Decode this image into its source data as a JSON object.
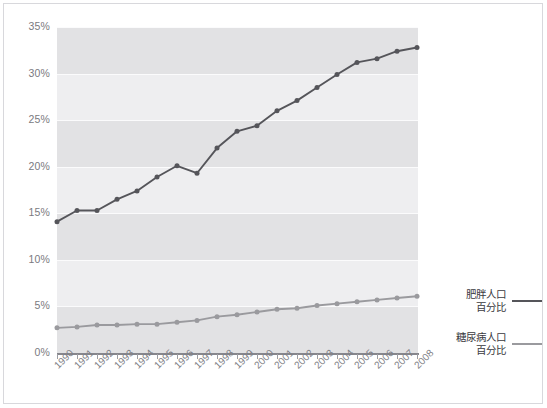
{
  "chart_data": {
    "type": "line",
    "title": "",
    "subtitle": "",
    "xlabel": "",
    "ylabel": "",
    "grid": true,
    "legend_position": "right",
    "ylim": [
      0,
      35
    ],
    "ytick_labels": [
      "35%",
      "30%",
      "25%",
      "20%",
      "15%",
      "10%",
      "5%",
      "0%"
    ],
    "ytick_values": [
      35,
      30,
      25,
      20,
      15,
      10,
      5,
      0
    ],
    "categories": [
      "1990",
      "1991",
      "1992",
      "1993",
      "1994",
      "1995",
      "1996",
      "1997",
      "1998",
      "1999",
      "2000",
      "2001",
      "2002",
      "2003",
      "2004",
      "2005",
      "2006",
      "2007",
      "2008"
    ],
    "x": [
      1990,
      1991,
      1992,
      1993,
      1994,
      1995,
      1996,
      1997,
      1998,
      1999,
      2000,
      2001,
      2002,
      2003,
      2004,
      2005,
      2006,
      2007,
      2008
    ],
    "series": [
      {
        "name": "肥胖人口\n百分比",
        "name_line1": "肥胖人口",
        "name_line2": "百分比",
        "color": "#55555a",
        "marker": "circle",
        "values": [
          14.1,
          15.3,
          15.3,
          16.5,
          17.4,
          18.9,
          20.1,
          19.3,
          22.0,
          23.8,
          24.4,
          26.0,
          27.1,
          28.5,
          29.9,
          31.2,
          31.6,
          32.4,
          32.8
        ]
      },
      {
        "name": "糖尿病人口\n百分比",
        "name_line1": "糖尿病人口",
        "name_line2": "百分比",
        "color": "#9a9a9e",
        "marker": "circle",
        "values": [
          2.7,
          2.8,
          3.0,
          3.0,
          3.1,
          3.1,
          3.3,
          3.5,
          3.9,
          4.1,
          4.4,
          4.7,
          4.8,
          5.1,
          5.3,
          5.5,
          5.7,
          5.9,
          6.1
        ]
      }
    ]
  },
  "legend": {
    "entries": [
      {
        "line1": "肥胖人口",
        "line2": "百分比",
        "color": "#55555a"
      },
      {
        "line1": "糖尿病人口",
        "line2": "百分比",
        "color": "#9a9a9e"
      }
    ]
  },
  "colors": {
    "obesity_line": "#55555a",
    "diabetes_line": "#9a9a9e",
    "band_dark": "#e2e2e4",
    "band_light": "#eeeef0",
    "axis": "#86868c",
    "tick_label": "#7a7a80",
    "background": "#ffffff"
  }
}
